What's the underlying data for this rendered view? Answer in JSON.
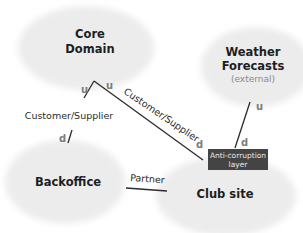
{
  "diagram": {
    "type": "context-map",
    "contexts": [
      {
        "id": "core",
        "title_lines": [
          "Core",
          "Domain"
        ],
        "subtitle": null
      },
      {
        "id": "weather",
        "title_lines": [
          "Weather",
          "Forecasts"
        ],
        "subtitle": "(external)"
      },
      {
        "id": "backoffice",
        "title_lines": [
          "Backoffice"
        ],
        "subtitle": null
      },
      {
        "id": "clubsite",
        "title_lines": [
          "Club site"
        ],
        "subtitle": null
      }
    ],
    "relationships": [
      {
        "from": "core",
        "to": "backoffice",
        "label": "Customer/Supplier",
        "upstream_marker": "u",
        "downstream_marker": "d"
      },
      {
        "from": "core",
        "to": "clubsite",
        "label": "Customer/Supplier",
        "upstream_marker": "u",
        "downstream_marker": "d"
      },
      {
        "from": "weather",
        "to": "clubsite",
        "label": null,
        "upstream_marker": "u",
        "downstream_marker": "d",
        "via": "Anti-corruption layer"
      },
      {
        "from": "backoffice",
        "to": "clubsite",
        "label": "Partner",
        "upstream_marker": null,
        "downstream_marker": null
      }
    ],
    "acl": {
      "lines": [
        "Anti-corruption",
        "layer"
      ]
    },
    "colors": {
      "context_fill": "#ececec",
      "line": "#2b2b2b",
      "marker_text": "#7d7d7d",
      "acl_fill": "#444444",
      "acl_text": "#e8e8e8",
      "subtitle": "#8a8a8a"
    }
  }
}
